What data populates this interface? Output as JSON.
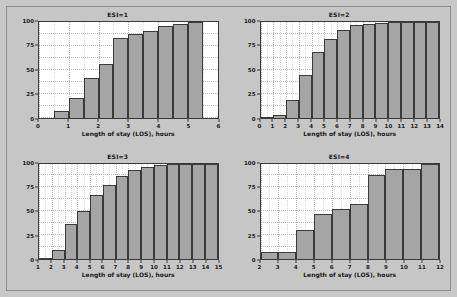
{
  "figure": {
    "background_color": "#c8c8c8",
    "panel_background_color": "#ffffff",
    "bar_color": "#a5a5a5",
    "bar_edge_color": "#3a3a3a",
    "grid_color": "#bdbdbd"
  },
  "chart_data": [
    {
      "type": "bar",
      "title": "ESI=1",
      "xlabel": "Length of stay (LOS), hours",
      "ylabel": "Cumulative Percent",
      "xlim": [
        0,
        6
      ],
      "ylim": [
        0,
        100
      ],
      "xticks": [
        0,
        1,
        2,
        3,
        4,
        5,
        6
      ],
      "yticks": [
        0,
        25,
        50,
        75,
        100
      ],
      "grid": true,
      "bin_width": 0.5,
      "bin_starts": [
        0.5,
        1.0,
        1.5,
        2.0,
        2.5,
        3.0,
        3.5,
        4.0,
        4.5,
        5.0
      ],
      "categories": [
        "0.5",
        "1.0",
        "1.5",
        "2.0",
        "2.5",
        "3.0",
        "3.5",
        "4.0",
        "4.5",
        "5.0"
      ],
      "values": [
        7,
        20,
        41,
        56,
        83,
        87,
        91,
        96,
        98,
        100
      ]
    },
    {
      "type": "bar",
      "title": "ESI=2",
      "xlabel": "Length of stay (LOS), hours",
      "ylabel": "Cumulative Percent",
      "xlim": [
        0,
        14
      ],
      "ylim": [
        0,
        100
      ],
      "xticks": [
        0,
        1,
        2,
        3,
        4,
        5,
        6,
        7,
        8,
        9,
        10,
        11,
        12,
        13,
        14
      ],
      "yticks": [
        0,
        25,
        50,
        75,
        100
      ],
      "grid": true,
      "bin_width": 1,
      "bin_starts": [
        0,
        1,
        2,
        3,
        4,
        5,
        6,
        7,
        8,
        9,
        10,
        11,
        12,
        13
      ],
      "categories": [
        "0",
        "1",
        "2",
        "3",
        "4",
        "5",
        "6",
        "7",
        "8",
        "9",
        "10",
        "11",
        "12",
        "13"
      ],
      "values": [
        1,
        3,
        18,
        44,
        69,
        82,
        92,
        97,
        98,
        99,
        100,
        100,
        100,
        100
      ]
    },
    {
      "type": "bar",
      "title": "ESI=3",
      "xlabel": "Length of stay (LOS), hours",
      "ylabel": "Cumulative Percent",
      "xlim": [
        1,
        15
      ],
      "ylim": [
        0,
        100
      ],
      "xticks": [
        1,
        2,
        3,
        4,
        5,
        6,
        7,
        8,
        9,
        10,
        11,
        12,
        13,
        14,
        15
      ],
      "yticks": [
        0,
        25,
        50,
        75,
        100
      ],
      "grid": true,
      "bin_width": 1,
      "bin_starts": [
        1,
        2,
        3,
        4,
        5,
        6,
        7,
        8,
        9,
        10,
        11,
        12,
        13,
        14
      ],
      "categories": [
        "1",
        "2",
        "3",
        "4",
        "5",
        "6",
        "7",
        "8",
        "9",
        "10",
        "11",
        "12",
        "13",
        "14"
      ],
      "values": [
        1,
        9,
        37,
        50,
        67,
        78,
        87,
        93,
        96,
        98,
        99,
        100,
        100,
        100
      ]
    },
    {
      "type": "bar",
      "title": "ESI=4",
      "xlabel": "Length of stay (LOS), hours",
      "ylabel": "Cumulative Percent",
      "xlim": [
        2,
        12
      ],
      "ylim": [
        0,
        100
      ],
      "xticks": [
        2,
        3,
        4,
        5,
        6,
        7,
        8,
        9,
        10,
        11,
        12
      ],
      "yticks": [
        0,
        25,
        50,
        75,
        100
      ],
      "grid": true,
      "bin_width": 1,
      "bin_starts": [
        2,
        3,
        4,
        5,
        6,
        7,
        8,
        9,
        10,
        11
      ],
      "categories": [
        "2",
        "3",
        "4",
        "5",
        "6",
        "7",
        "8",
        "9",
        "10",
        "11"
      ],
      "values": [
        7,
        7,
        30,
        47,
        52,
        58,
        88,
        94,
        94,
        100
      ]
    }
  ]
}
